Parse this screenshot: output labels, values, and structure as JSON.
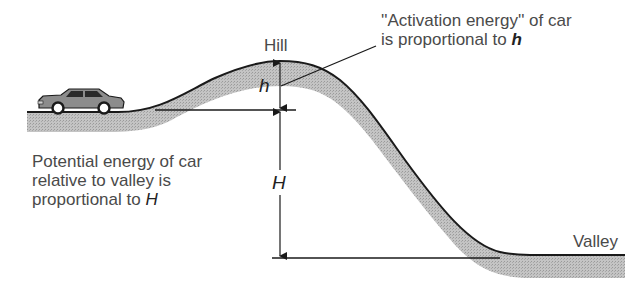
{
  "diagram": {
    "labels": {
      "hill": "Hill",
      "valley": "Valley",
      "h_symbol": "h",
      "H_symbol": "H"
    },
    "annotations": {
      "activation": {
        "line1": "''Activation energy'' of car",
        "line2_prefix": "is proportional to ",
        "line2_var": "h"
      },
      "potential": {
        "line1": "Potential energy of car",
        "line2": "relative to valley is",
        "line3_prefix": "proportional to ",
        "line3_var": "H"
      }
    },
    "elements": [
      "car",
      "hill-terrain",
      "h-dimension-arrow",
      "H-dimension-arrow",
      "reference-lines",
      "leader-line"
    ],
    "colors": {
      "terrain_fill": "#bdbdbd",
      "outline": "#1a1a1a",
      "text": "#4a4a4a"
    }
  }
}
